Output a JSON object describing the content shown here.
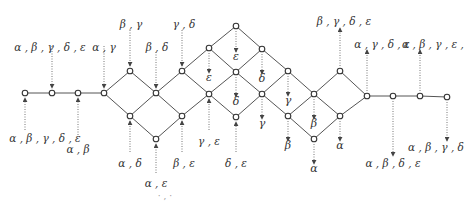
{
  "diagram": {
    "type": "lattice",
    "nodes": [
      {
        "id": "n1",
        "x": 25,
        "y": 93
      },
      {
        "id": "n2",
        "x": 52,
        "y": 93
      },
      {
        "id": "n3",
        "x": 78,
        "y": 93
      },
      {
        "id": "n4",
        "x": 104,
        "y": 93
      },
      {
        "id": "n5",
        "x": 130,
        "y": 71
      },
      {
        "id": "n6",
        "x": 130,
        "y": 116
      },
      {
        "id": "n7",
        "x": 156,
        "y": 93
      },
      {
        "id": "n8",
        "x": 156,
        "y": 139
      },
      {
        "id": "n9",
        "x": 182,
        "y": 71
      },
      {
        "id": "n10",
        "x": 182,
        "y": 116
      },
      {
        "id": "n11",
        "x": 209,
        "y": 48
      },
      {
        "id": "n12",
        "x": 209,
        "y": 94
      },
      {
        "id": "n13",
        "x": 236,
        "y": 26
      },
      {
        "id": "n14",
        "x": 236,
        "y": 72
      },
      {
        "id": "n15",
        "x": 236,
        "y": 117
      },
      {
        "id": "n16",
        "x": 262,
        "y": 49
      },
      {
        "id": "n17",
        "x": 262,
        "y": 94
      },
      {
        "id": "n18",
        "x": 288,
        "y": 71
      },
      {
        "id": "n19",
        "x": 288,
        "y": 116
      },
      {
        "id": "n20",
        "x": 314,
        "y": 94
      },
      {
        "id": "n21",
        "x": 314,
        "y": 139
      },
      {
        "id": "n22",
        "x": 340,
        "y": 71
      },
      {
        "id": "n23",
        "x": 340,
        "y": 116
      },
      {
        "id": "n24",
        "x": 367,
        "y": 96
      },
      {
        "id": "n25",
        "x": 393,
        "y": 96
      },
      {
        "id": "n26",
        "x": 420,
        "y": 96
      },
      {
        "id": "n27",
        "x": 447,
        "y": 97
      }
    ],
    "edges": [
      [
        "n1",
        "n2"
      ],
      [
        "n2",
        "n3"
      ],
      [
        "n3",
        "n4"
      ],
      [
        "n4",
        "n5"
      ],
      [
        "n4",
        "n6"
      ],
      [
        "n5",
        "n7"
      ],
      [
        "n6",
        "n7"
      ],
      [
        "n6",
        "n8"
      ],
      [
        "n7",
        "n9"
      ],
      [
        "n7",
        "n10"
      ],
      [
        "n8",
        "n10"
      ],
      [
        "n9",
        "n11"
      ],
      [
        "n9",
        "n12"
      ],
      [
        "n10",
        "n12"
      ],
      [
        "n11",
        "n13"
      ],
      [
        "n11",
        "n14"
      ],
      [
        "n12",
        "n14"
      ],
      [
        "n12",
        "n15"
      ],
      [
        "n13",
        "n16"
      ],
      [
        "n14",
        "n16"
      ],
      [
        "n14",
        "n17"
      ],
      [
        "n15",
        "n17"
      ],
      [
        "n16",
        "n18"
      ],
      [
        "n17",
        "n18"
      ],
      [
        "n17",
        "n19"
      ],
      [
        "n18",
        "n20"
      ],
      [
        "n19",
        "n20"
      ],
      [
        "n19",
        "n21"
      ],
      [
        "n20",
        "n22"
      ],
      [
        "n20",
        "n23"
      ],
      [
        "n21",
        "n23"
      ],
      [
        "n22",
        "n24"
      ],
      [
        "n23",
        "n24"
      ],
      [
        "n24",
        "n25"
      ],
      [
        "n25",
        "n26"
      ],
      [
        "n26",
        "n27"
      ]
    ],
    "arrows": [
      {
        "from": [
          52,
          46
        ],
        "to": [
          52,
          88
        ],
        "dir": "down"
      },
      {
        "from": [
          104,
          46
        ],
        "to": [
          104,
          88
        ],
        "dir": "down"
      },
      {
        "from": [
          130,
          30
        ],
        "to": [
          130,
          66
        ],
        "dir": "down"
      },
      {
        "from": [
          156,
          52
        ],
        "to": [
          156,
          88
        ],
        "dir": "down"
      },
      {
        "from": [
          182,
          30
        ],
        "to": [
          182,
          66
        ],
        "dir": "down"
      },
      {
        "from": [
          236,
          31
        ],
        "to": [
          236,
          52
        ],
        "dir": "down"
      },
      {
        "from": [
          209,
          53
        ],
        "to": [
          209,
          73
        ],
        "dir": "down"
      },
      {
        "from": [
          262,
          54
        ],
        "to": [
          262,
          74
        ],
        "dir": "down"
      },
      {
        "from": [
          236,
          77
        ],
        "to": [
          236,
          97
        ],
        "dir": "down"
      },
      {
        "from": [
          288,
          76
        ],
        "to": [
          288,
          96
        ],
        "dir": "down"
      },
      {
        "from": [
          262,
          99
        ],
        "to": [
          262,
          119
        ],
        "dir": "down"
      },
      {
        "from": [
          314,
          99
        ],
        "to": [
          314,
          119
        ],
        "dir": "down"
      },
      {
        "from": [
          288,
          121
        ],
        "to": [
          288,
          141
        ],
        "dir": "down"
      },
      {
        "from": [
          340,
          121
        ],
        "to": [
          340,
          141
        ],
        "dir": "down"
      },
      {
        "from": [
          314,
          144
        ],
        "to": [
          314,
          164
        ],
        "dir": "down"
      },
      {
        "from": [
          25,
          130
        ],
        "to": [
          25,
          98
        ],
        "dir": "up"
      },
      {
        "from": [
          78,
          135
        ],
        "to": [
          78,
          98
        ],
        "dir": "up"
      },
      {
        "from": [
          130,
          152
        ],
        "to": [
          130,
          121
        ],
        "dir": "up"
      },
      {
        "from": [
          156,
          173
        ],
        "to": [
          156,
          144
        ],
        "dir": "up"
      },
      {
        "from": [
          182,
          152
        ],
        "to": [
          182,
          121
        ],
        "dir": "up"
      },
      {
        "from": [
          209,
          130
        ],
        "to": [
          209,
          99
        ],
        "dir": "up"
      },
      {
        "from": [
          236,
          152
        ],
        "to": [
          236,
          122
        ],
        "dir": "up"
      },
      {
        "from": [
          340,
          66
        ],
        "to": [
          340,
          28
        ],
        "dir": "up"
      },
      {
        "from": [
          367,
          91
        ],
        "to": [
          367,
          50
        ],
        "dir": "up"
      },
      {
        "from": [
          420,
          91
        ],
        "to": [
          420,
          50
        ],
        "dir": "up"
      },
      {
        "from": [
          393,
          101
        ],
        "to": [
          393,
          156
        ],
        "dir": "down"
      },
      {
        "from": [
          447,
          102
        ],
        "to": [
          447,
          141
        ],
        "dir": "down"
      }
    ],
    "labels": [
      {
        "text": "α , β , γ , δ , ε",
        "x": 50,
        "y": 51
      },
      {
        "text": "α , γ",
        "x": 104,
        "y": 51
      },
      {
        "text": "β , γ",
        "x": 131,
        "y": 28
      },
      {
        "text": "β , δ",
        "x": 157,
        "y": 51
      },
      {
        "text": "γ , δ",
        "x": 184,
        "y": 28
      },
      {
        "text": "ε",
        "x": 236,
        "y": 60
      },
      {
        "text": "ε",
        "x": 209,
        "y": 81
      },
      {
        "text": "δ",
        "x": 262,
        "y": 82
      },
      {
        "text": "δ",
        "x": 236,
        "y": 105
      },
      {
        "text": "γ",
        "x": 288,
        "y": 104
      },
      {
        "text": "γ",
        "x": 262,
        "y": 127
      },
      {
        "text": "β",
        "x": 314,
        "y": 127
      },
      {
        "text": "β",
        "x": 288,
        "y": 149
      },
      {
        "text": "α",
        "x": 340,
        "y": 149
      },
      {
        "text": "α",
        "x": 314,
        "y": 172
      },
      {
        "text": "α , β , γ , δ , ε",
        "x": 45,
        "y": 142
      },
      {
        "text": "α , β",
        "x": 78,
        "y": 153
      },
      {
        "text": "α , δ",
        "x": 130,
        "y": 167
      },
      {
        "text": "α , ε",
        "x": 156,
        "y": 187
      },
      {
        "text": "β , ε",
        "x": 184,
        "y": 167
      },
      {
        "text": "γ , ε",
        "x": 209,
        "y": 145
      },
      {
        "text": "δ , ε",
        "x": 236,
        "y": 167
      },
      {
        "text": "β , γ , δ , ε",
        "x": 344,
        "y": 25
      },
      {
        "text": "α , γ , δ , ε",
        "x": 382,
        "y": 48
      },
      {
        "text": "α , β , γ , ε ,",
        "x": 433,
        "y": 48
      },
      {
        "text": "α , β , δ , ε",
        "x": 393,
        "y": 167
      },
      {
        "text": "α , β , γ , δ",
        "x": 436,
        "y": 151
      }
    ],
    "artifact": {
      "text": "· , ·",
      "x": 165,
      "y": 199
    }
  }
}
